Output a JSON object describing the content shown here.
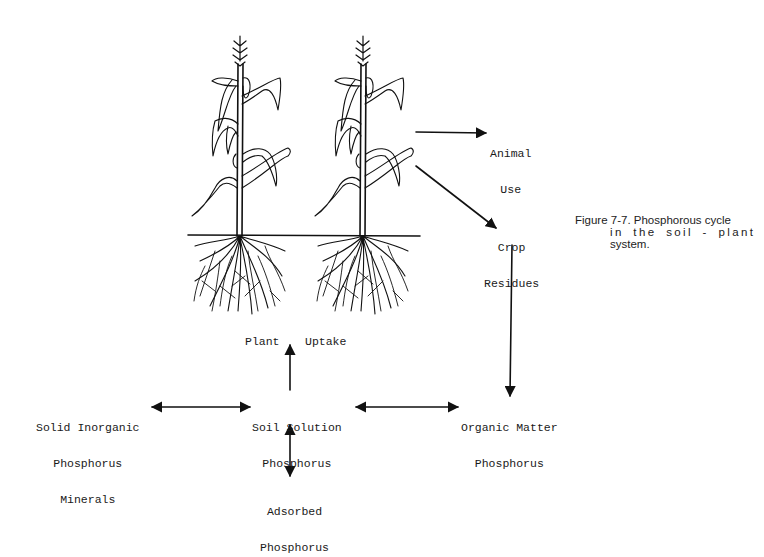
{
  "diagram": {
    "title": "Phosphorous cycle in the soil - plant system",
    "caption": {
      "line1": "Figure 7-7. Phosphorous cycle",
      "line2": "in the soil - plant",
      "line3": "system."
    },
    "nodes": {
      "animal_use": {
        "line1": "Animal",
        "line2": "Use"
      },
      "crop_residues": {
        "line1": "Crop",
        "line2": "Residues"
      },
      "plant_uptake": {
        "left": "Plant",
        "right": "Uptake"
      },
      "solid_inorganic": {
        "line1": "Solid Inorganic",
        "line2": "Phosphorus",
        "line3": "Minerals"
      },
      "soil_solution": {
        "line1": "Soil Solution",
        "line2": "Phosphorus"
      },
      "organic_matter": {
        "line1": "Organic Matter",
        "line2": "Phosphorus"
      },
      "adsorbed": {
        "line1": "Adsorbed",
        "line2": "Phosphorus"
      }
    },
    "edges": [
      {
        "from": "plants",
        "to": "animal_use",
        "type": "one-way"
      },
      {
        "from": "plants",
        "to": "crop_residues",
        "type": "one-way"
      },
      {
        "from": "crop_residues",
        "to": "organic_matter",
        "type": "one-way"
      },
      {
        "from": "soil_solution",
        "to": "plant_uptake",
        "type": "one-way"
      },
      {
        "from": "solid_inorganic",
        "to": "soil_solution",
        "type": "two-way"
      },
      {
        "from": "soil_solution",
        "to": "organic_matter",
        "type": "two-way"
      },
      {
        "from": "soil_solution",
        "to": "adsorbed",
        "type": "two-way"
      }
    ],
    "illustration": {
      "plants": [
        "corn-plant-icon",
        "corn-plant-icon"
      ],
      "ink_color": "#111111"
    }
  }
}
